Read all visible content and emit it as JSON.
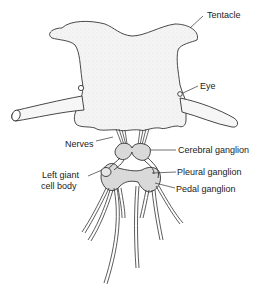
{
  "diagram": {
    "colors": {
      "outline": "#333333",
      "body_fill": "#f4f4f4",
      "stipple": "#bbbbbb",
      "ganglion_fill": "#d9d9d9",
      "background": "#ffffff"
    },
    "labels": {
      "tentacle": "Tentacle",
      "eye": "Eye",
      "nerves": "Nerves",
      "cerebral_ganglion": "Cerebral ganglion",
      "left_giant_cell_line1": "Left giant",
      "left_giant_cell_line2": "cell body",
      "pleural_ganglion": "Pleural ganglion",
      "pedal_ganglion": "Pedal ganglion"
    }
  }
}
